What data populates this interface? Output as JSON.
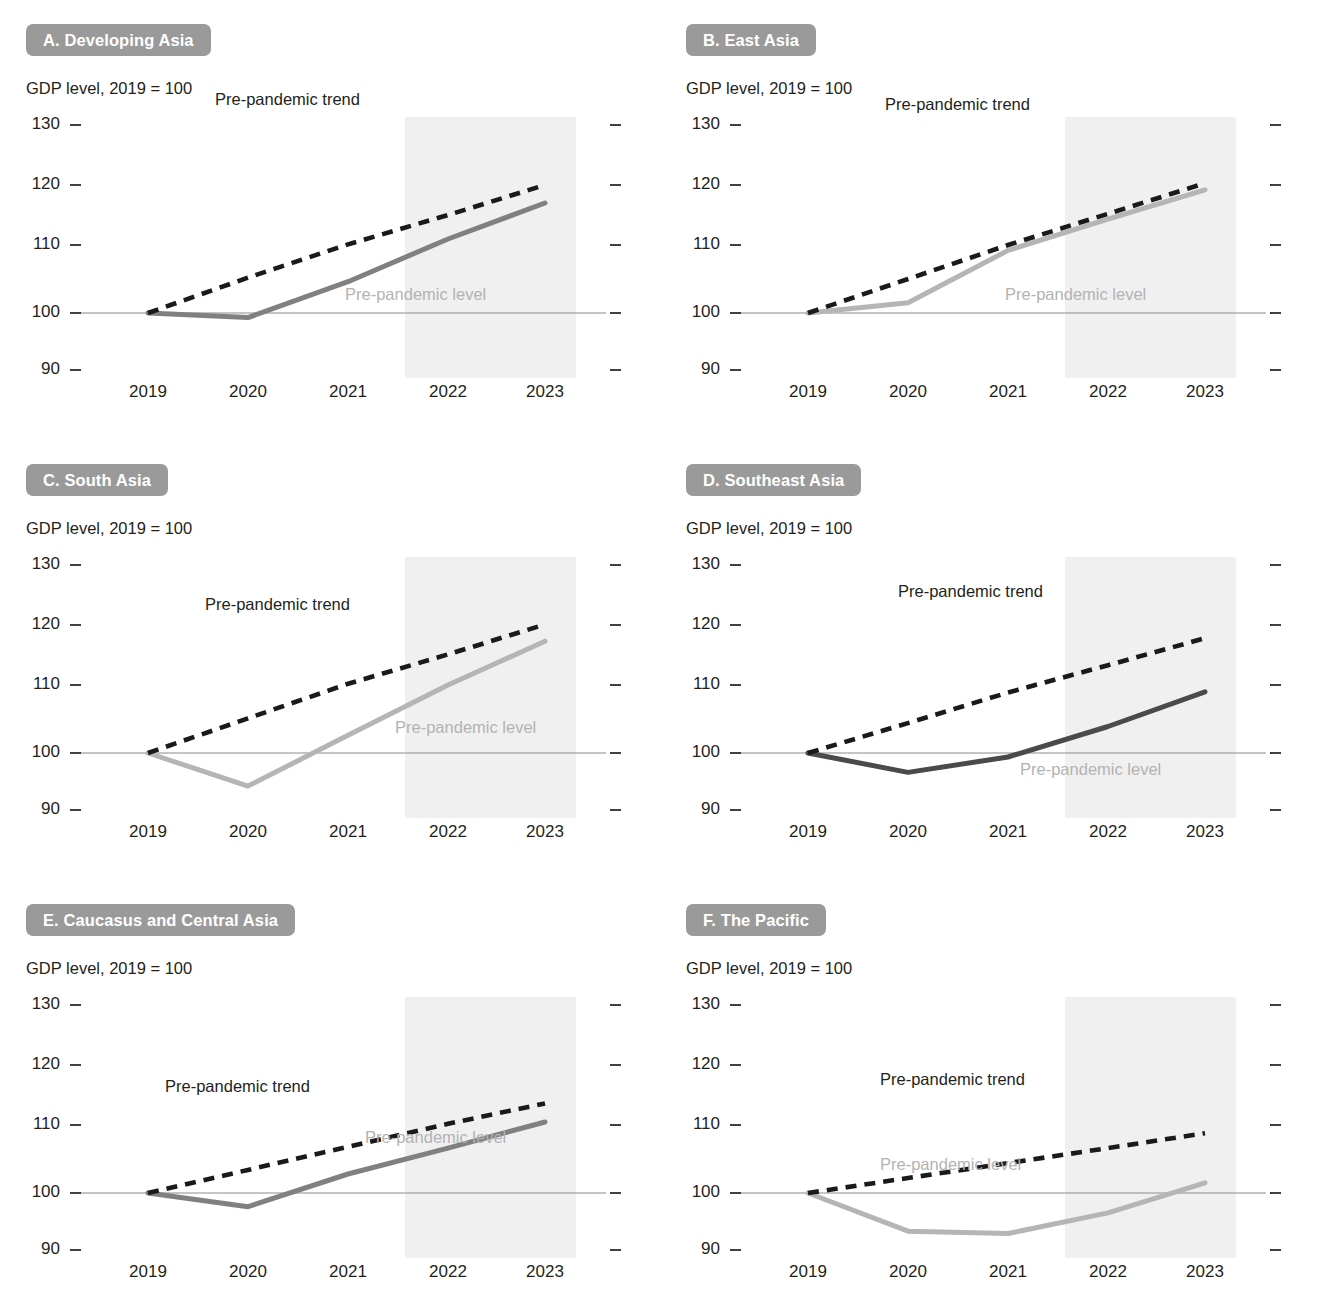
{
  "figure": {
    "yticks": [
      "130",
      "120",
      "110",
      "100",
      "90"
    ],
    "ytick_values": [
      130,
      120,
      110,
      100,
      90
    ],
    "xticks": [
      "2019",
      "2020",
      "2021",
      "2022",
      "2023"
    ],
    "subtitle": "GDP level, 2019 = 100",
    "trend_label": "Pre-pandemic trend",
    "level_label": "Pre-pandemic level",
    "colors": {
      "badge": "#9a9a9a",
      "badge_text": "#ffffff",
      "trend": "#1a1a1a",
      "baseline": "#8c8c8c",
      "forecast_band": "#f0f0f0",
      "level_label": "#b3b3b3",
      "text": "#231f20",
      "line_medium_gray": "#808080",
      "line_light_gray": "#b5b5b5",
      "line_dark_gray": "#4a4a4a"
    }
  },
  "chart_data": [
    {
      "type": "line",
      "panel": "A",
      "title": "A. Developing Asia",
      "subtitle": "GDP level, 2019 = 100",
      "xlabel": "",
      "ylabel": "GDP level, 2019 = 100",
      "ylim": [
        90,
        130
      ],
      "x": [
        2019,
        2020,
        2021,
        2022,
        2023
      ],
      "grid": false,
      "legend": "inline-annotations",
      "line_color": "#808080",
      "forecast_from": 2021.6,
      "series": [
        {
          "name": "Pre-pandemic trend",
          "style": "dashed",
          "values": [
            100,
            105.2,
            110.1,
            115.0,
            120.0
          ]
        },
        {
          "name": "Actual GDP",
          "style": "solid",
          "values": [
            100,
            99.2,
            104.6,
            111.0,
            117.0
          ]
        },
        {
          "name": "Pre-pandemic level",
          "style": "baseline",
          "values": [
            100,
            100,
            100,
            100,
            100
          ]
        }
      ]
    },
    {
      "type": "line",
      "panel": "B",
      "title": "B. East Asia",
      "subtitle": "GDP level, 2019 = 100",
      "xlabel": "",
      "ylabel": "GDP level, 2019 = 100",
      "ylim": [
        90,
        130
      ],
      "x": [
        2019,
        2020,
        2021,
        2022,
        2023
      ],
      "grid": false,
      "legend": "inline-annotations",
      "line_color": "#b5b5b5",
      "forecast_from": 2021.6,
      "series": [
        {
          "name": "Pre-pandemic trend",
          "style": "dashed",
          "values": [
            100,
            105.0,
            110.0,
            115.2,
            120.3
          ]
        },
        {
          "name": "Actual GDP",
          "style": "solid",
          "values": [
            100,
            101.5,
            109.2,
            114.3,
            119.2
          ]
        },
        {
          "name": "Pre-pandemic level",
          "style": "baseline",
          "values": [
            100,
            100,
            100,
            100,
            100
          ]
        }
      ]
    },
    {
      "type": "line",
      "panel": "C",
      "title": "C. South Asia",
      "subtitle": "GDP level, 2019 = 100",
      "xlabel": "",
      "ylabel": "GDP level, 2019 = 100",
      "ylim": [
        90,
        130
      ],
      "x": [
        2019,
        2020,
        2021,
        2022,
        2023
      ],
      "grid": false,
      "legend": "inline-annotations",
      "line_color": "#b5b5b5",
      "forecast_from": 2021.6,
      "series": [
        {
          "name": "Pre-pandemic trend",
          "style": "dashed",
          "values": [
            100,
            105.1,
            110.2,
            115.1,
            120.1
          ]
        },
        {
          "name": "Actual GDP",
          "style": "solid",
          "values": [
            100,
            94.2,
            102.6,
            110.0,
            117.3
          ]
        },
        {
          "name": "Pre-pandemic level",
          "style": "baseline",
          "values": [
            100,
            100,
            100,
            100,
            100
          ]
        }
      ]
    },
    {
      "type": "line",
      "panel": "D",
      "title": "D. Southeast Asia",
      "subtitle": "GDP level, 2019 = 100",
      "xlabel": "",
      "ylabel": "GDP level, 2019 = 100",
      "ylim": [
        90,
        130
      ],
      "x": [
        2019,
        2020,
        2021,
        2022,
        2023
      ],
      "grid": false,
      "legend": "inline-annotations",
      "line_color": "#4a4a4a",
      "forecast_from": 2021.6,
      "series": [
        {
          "name": "Pre-pandemic trend",
          "style": "dashed",
          "values": [
            100,
            104.4,
            108.9,
            113.3,
            117.8
          ]
        },
        {
          "name": "Actual GDP",
          "style": "solid",
          "values": [
            100,
            96.6,
            99.3,
            103.9,
            109.0
          ]
        },
        {
          "name": "Pre-pandemic level",
          "style": "baseline",
          "values": [
            100,
            100,
            100,
            100,
            100
          ]
        }
      ]
    },
    {
      "type": "line",
      "panel": "E",
      "title": "E. Caucasus and Central Asia",
      "subtitle": "GDP level, 2019 = 100",
      "xlabel": "",
      "ylabel": "GDP level, 2019 = 100",
      "ylim": [
        90,
        130
      ],
      "x": [
        2019,
        2020,
        2021,
        2022,
        2023
      ],
      "grid": false,
      "legend": "inline-annotations",
      "line_color": "#808080",
      "forecast_from": 2021.6,
      "series": [
        {
          "name": "Pre-pandemic trend",
          "style": "dashed",
          "values": [
            100,
            103.4,
            106.8,
            110.2,
            113.6
          ]
        },
        {
          "name": "Actual GDP",
          "style": "solid",
          "values": [
            100,
            97.6,
            102.8,
            106.6,
            110.5
          ]
        },
        {
          "name": "Pre-pandemic level",
          "style": "baseline",
          "values": [
            100,
            100,
            100,
            100,
            100
          ]
        }
      ]
    },
    {
      "type": "line",
      "panel": "F",
      "title": "F. The Pacific",
      "subtitle": "GDP level, 2019 = 100",
      "xlabel": "",
      "ylabel": "GDP level, 2019 = 100",
      "ylim": [
        90,
        130
      ],
      "x": [
        2019,
        2020,
        2021,
        2022,
        2023
      ],
      "grid": false,
      "legend": "inline-annotations",
      "line_color": "#b5b5b5",
      "forecast_from": 2021.6,
      "series": [
        {
          "name": "Pre-pandemic trend",
          "style": "dashed",
          "values": [
            100,
            102.2,
            104.4,
            106.6,
            108.8
          ]
        },
        {
          "name": "Actual GDP",
          "style": "solid",
          "values": [
            100,
            93.3,
            92.9,
            96.5,
            101.5
          ]
        },
        {
          "name": "Pre-pandemic level",
          "style": "baseline",
          "values": [
            100,
            100,
            100,
            100,
            100
          ]
        }
      ]
    }
  ]
}
